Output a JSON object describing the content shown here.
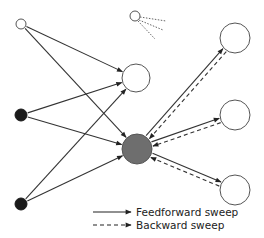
{
  "diagram": {
    "type": "network",
    "nodes": [
      {
        "id": "input-open-top",
        "x": 21,
        "y": 24,
        "r": 5,
        "fill": "#ffffff",
        "kind": "open"
      },
      {
        "id": "input-filled-mid",
        "x": 21,
        "y": 115,
        "r": 6,
        "fill": "#1a1a1a",
        "kind": "filled"
      },
      {
        "id": "input-filled-bottom",
        "x": 21,
        "y": 204,
        "r": 6,
        "fill": "#1a1a1a",
        "kind": "filled"
      },
      {
        "id": "hidden-top",
        "x": 136,
        "y": 78,
        "r": 14,
        "fill": "#ffffff",
        "kind": "open"
      },
      {
        "id": "hidden-center",
        "x": 137,
        "y": 149,
        "r": 15,
        "fill": "#6e6e6e",
        "kind": "shaded"
      },
      {
        "id": "output-top",
        "x": 235,
        "y": 38,
        "r": 15,
        "fill": "#ffffff",
        "kind": "open"
      },
      {
        "id": "output-mid",
        "x": 235,
        "y": 115,
        "r": 15,
        "fill": "#ffffff",
        "kind": "open"
      },
      {
        "id": "output-bottom",
        "x": 235,
        "y": 190,
        "r": 15,
        "fill": "#ffffff",
        "kind": "open"
      },
      {
        "id": "light-source",
        "x": 135,
        "y": 16,
        "r": 5,
        "fill": "#ffffff",
        "kind": "emitter"
      }
    ],
    "feedforward_edges": [
      {
        "from": "input-open-top",
        "to": "hidden-top"
      },
      {
        "from": "input-open-top",
        "to": "hidden-center"
      },
      {
        "from": "input-filled-mid",
        "to": "hidden-top"
      },
      {
        "from": "input-filled-mid",
        "to": "hidden-center"
      },
      {
        "from": "input-filled-bottom",
        "to": "hidden-top"
      },
      {
        "from": "input-filled-bottom",
        "to": "hidden-center"
      },
      {
        "from": "hidden-center",
        "to": "output-top"
      },
      {
        "from": "hidden-center",
        "to": "output-mid"
      },
      {
        "from": "hidden-center",
        "to": "output-bottom"
      }
    ],
    "backward_edges": [
      {
        "from": "output-top",
        "to": "hidden-center"
      },
      {
        "from": "output-mid",
        "to": "hidden-center"
      },
      {
        "from": "output-bottom",
        "to": "hidden-center"
      }
    ],
    "colors": {
      "line": "#333333",
      "node_stroke": "#555555",
      "shaded": "#6e6e6e",
      "filled": "#1a1a1a"
    }
  },
  "legend": {
    "feedforward_label": "Feedforward sweep",
    "backward_label": "Backward sweep"
  }
}
